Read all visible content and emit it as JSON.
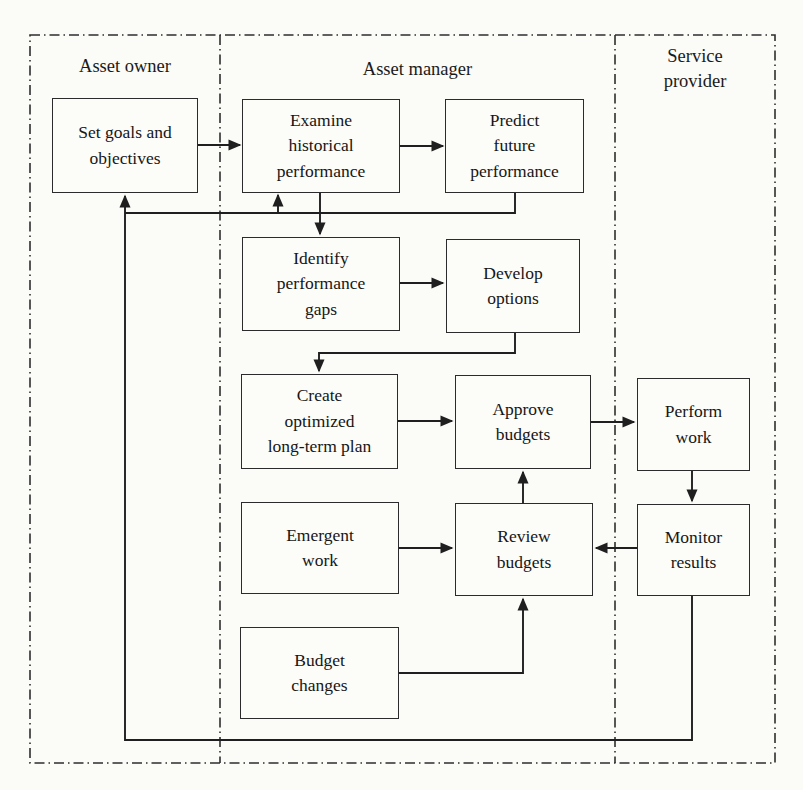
{
  "diagram": {
    "lanes": [
      {
        "label": "Asset owner"
      },
      {
        "label": "Asset manager"
      },
      {
        "label": "Service\nprovider"
      }
    ],
    "boxes": {
      "set_goals": "Set goals and\nobjectives",
      "examine": "Examine\nhistorical\nperformance",
      "predict": "Predict\nfuture\nperformance",
      "identify": "Identify\nperformance\ngaps",
      "develop": "Develop\noptions",
      "create": "Create\noptimized\nlong-term plan",
      "approve": "Approve\nbudgets",
      "emergent": "Emergent\nwork",
      "review": "Review\nbudgets",
      "budget_changes": "Budget\nchanges",
      "perform": "Perform\nwork",
      "monitor": "Monitor\nresults"
    },
    "colors": {
      "line": "#1f1f1f",
      "paper": "#fbfbf8",
      "box_fill": "#fcfcf9",
      "text": "#161616"
    }
  }
}
